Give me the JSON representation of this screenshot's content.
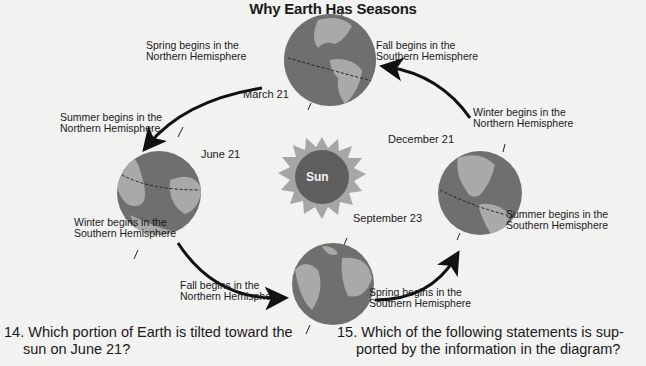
{
  "title": "Why Earth Has Seasons",
  "sun_label": "Sun",
  "earths": {
    "march": {
      "date": "March 21",
      "left_label": [
        "Spring begins in the",
        "Northern Hemisphere"
      ],
      "right_label": [
        "Fall begins in the",
        "Southern Hemisphere"
      ]
    },
    "june": {
      "date": "June 21",
      "top_label": [
        "Summer begins in the",
        "Northern Hemisphere"
      ],
      "bottom_label": [
        "Winter begins in the",
        "Southern Hemisphere"
      ]
    },
    "september": {
      "date": "September 23",
      "left_label": [
        "Fall begins in the",
        "Northern Hemisphere"
      ],
      "right_label": [
        "Spring begins in the",
        "Southern Hemisphere"
      ]
    },
    "december": {
      "date": "December 21",
      "top_label": [
        "Winter begins in the",
        "Northern Hemisphere"
      ],
      "bottom_label": [
        "Summer begins in the",
        "Southern Hemisphere"
      ]
    }
  },
  "questions": [
    {
      "number": "14.",
      "lines": [
        "Which portion of Earth is tilted toward the",
        "sun on June 21?"
      ]
    },
    {
      "number": "15.",
      "lines": [
        "Which of the following statements is sup-",
        "ported by the information in the diagram?"
      ]
    }
  ],
  "colors": {
    "background": "#f2f2f0",
    "ocean": "#6f6f6f",
    "land": "#a9a9a9",
    "sun_core": "#5e5e5e",
    "sun_rays": "#a6a6a6",
    "arrow": "#111111"
  }
}
